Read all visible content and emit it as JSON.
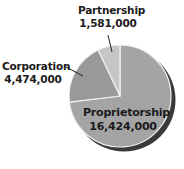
{
  "chart_data": {
    "type": "pie",
    "title": "",
    "start_angle_deg": 0,
    "direction": "clockwise",
    "slices": [
      {
        "label": "Proprietorship",
        "value": 16424000,
        "display": "16,424,000",
        "color": "#a4a4a4"
      },
      {
        "label": "Corporation",
        "value": 4474000,
        "display": "4,474,000",
        "color": "#999999"
      },
      {
        "label": "Partnership",
        "value": 1581000,
        "display": "1,581,000",
        "color": "#c6c6c6"
      }
    ],
    "shadow_color": "#3a3a3a",
    "divider_color": "#f2f2f2",
    "legend": "none",
    "labels_position": "callout"
  },
  "labels": {
    "partnership": {
      "name": "Partnership",
      "value": "1,581,000"
    },
    "corporation": {
      "name": "Corporation",
      "value": "4,474,000"
    },
    "proprietorship": {
      "name": "Proprietorship",
      "value": "16,424,000"
    }
  }
}
